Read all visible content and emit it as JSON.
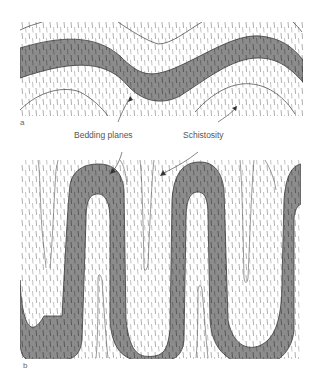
{
  "figure": {
    "panels": [
      {
        "id": "a",
        "label": "a",
        "description": "Open fold of bedding with steep schistosity"
      },
      {
        "id": "b",
        "label": "b",
        "description": "Tight isoclinal folds of bedding with parallel schistosity"
      }
    ],
    "annotations": {
      "bedding": "Bedding planes",
      "schistosity": "Schistosity"
    },
    "colors": {
      "bed_fill": "#8c8c8c",
      "bed_outline": "#3a3a3a",
      "schistosity_ticks": "#9a9a9a",
      "background": "#ffffff",
      "text": "#555555"
    }
  }
}
